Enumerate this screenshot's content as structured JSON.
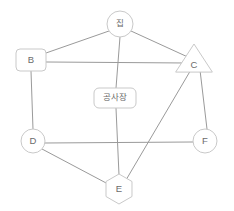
{
  "diagram": {
    "background_color": "#ffffff",
    "edge_color": "#9a9a9a",
    "node_stroke_color": "#c9c9c9",
    "node_fill_color": "#ffffff",
    "label_color": "#6b6b6b",
    "nodes": [
      {
        "id": "house",
        "label": "집",
        "shape": "circle",
        "cx": 120,
        "cy": 24,
        "r": 13
      },
      {
        "id": "b",
        "label": "B",
        "shape": "rounded-rect",
        "cx": 31,
        "cy": 60,
        "w": 30,
        "h": 22,
        "rx": 4
      },
      {
        "id": "c",
        "label": "C",
        "shape": "triangle",
        "cx": 194,
        "cy": 62,
        "size": 18
      },
      {
        "id": "construction",
        "label": "공사장",
        "shape": "rounded-rect",
        "cx": 115,
        "cy": 98,
        "w": 42,
        "h": 20,
        "rx": 5
      },
      {
        "id": "d",
        "label": "D",
        "shape": "circle",
        "cx": 33,
        "cy": 141,
        "r": 12
      },
      {
        "id": "e",
        "label": "E",
        "shape": "hexagon",
        "cx": 119,
        "cy": 189,
        "r": 15
      },
      {
        "id": "f",
        "label": "F",
        "shape": "circle",
        "cx": 205,
        "cy": 141,
        "r": 12
      }
    ],
    "edges": [
      {
        "id": "house-b",
        "from": "house",
        "to": "b",
        "x1": 109,
        "y1": 31,
        "x2": 46,
        "y2": 53
      },
      {
        "id": "house-c",
        "from": "house",
        "to": "c",
        "x1": 131,
        "y1": 31,
        "x2": 190,
        "y2": 58
      },
      {
        "id": "house-construction",
        "from": "house",
        "to": "construction",
        "x1": 120,
        "y1": 37,
        "x2": 116,
        "y2": 88
      },
      {
        "id": "b-c",
        "from": "b",
        "to": "c",
        "x1": 46,
        "y1": 62,
        "x2": 187,
        "y2": 63
      },
      {
        "id": "b-d",
        "from": "b",
        "to": "d",
        "x1": 31,
        "y1": 71,
        "x2": 33,
        "y2": 129
      },
      {
        "id": "construction-e",
        "from": "construction",
        "to": "e",
        "x1": 116,
        "y1": 108,
        "x2": 119,
        "y2": 175
      },
      {
        "id": "c-e",
        "from": "c",
        "to": "e",
        "x1": 192,
        "y1": 68,
        "x2": 126,
        "y2": 180
      },
      {
        "id": "c-f",
        "from": "c",
        "to": "f",
        "x1": 200,
        "y1": 70,
        "x2": 207,
        "y2": 129
      },
      {
        "id": "d-e",
        "from": "d",
        "to": "e",
        "x1": 42,
        "y1": 149,
        "x2": 108,
        "y2": 184
      },
      {
        "id": "d-f",
        "from": "d",
        "to": "f",
        "x1": 45,
        "y1": 143,
        "x2": 193,
        "y2": 142
      }
    ]
  }
}
